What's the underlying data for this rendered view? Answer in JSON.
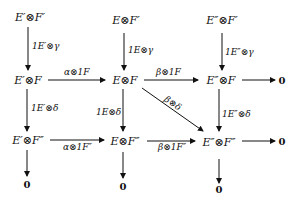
{
  "diagram": {
    "type": "commutative-diagram",
    "nodes": {
      "r1c1": "E′⊗F′",
      "r1c2": "E⊗F′",
      "r1c3": "E″⊗F′",
      "r2c1": "E′⊗F",
      "r2c2": "E⊗F",
      "r2c3": "E″⊗F",
      "r2c4": "0",
      "r3c1": "E′⊗F″",
      "r3c2": "E⊗F″",
      "r3c3": "E″⊗F″",
      "r3c4": "0",
      "r4c1": "0",
      "r4c2": "0",
      "r4c3": "0"
    },
    "arrows": {
      "r1c1_r2c1": "1E′⊗γ",
      "r1c2_r2c2": "1E⊗γ",
      "r1c3_r2c3": "1E″⊗γ",
      "r2c1_r2c2": "α⊗1F",
      "r2c2_r2c3": "β⊗1F",
      "r2c2_r3c3": "β⊗δ",
      "r2c1_r3c1": "1E′⊗δ",
      "r2c2_r3c2": "1E⊗δ",
      "r2c3_r3c3": "1E″⊗δ",
      "r3c1_r3c2": "α⊗1F″",
      "r3c2_r3c3": "β⊗1F″"
    }
  }
}
